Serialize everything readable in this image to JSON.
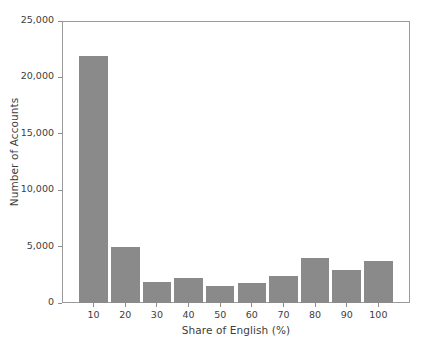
{
  "chart_data": {
    "type": "bar",
    "title": "",
    "xlabel": "Share of English (%)",
    "ylabel": "Number of Accounts",
    "categories": [
      "10",
      "20",
      "30",
      "40",
      "50",
      "60",
      "70",
      "80",
      "90",
      "100"
    ],
    "values": [
      22000,
      5000,
      1900,
      2200,
      1500,
      1800,
      2400,
      4000,
      2900,
      3700
    ],
    "xlim": [
      0,
      110
    ],
    "ylim": [
      0,
      25000
    ],
    "ytick_values": [
      0,
      5000,
      10000,
      15000,
      20000,
      25000
    ],
    "ytick_labels": [
      "0",
      "5,000",
      "10,000",
      "15,000",
      "20,000",
      "25,000"
    ],
    "xtick_values": [
      10,
      20,
      30,
      40,
      50,
      60,
      70,
      80,
      90,
      100
    ],
    "xtick_labels": [
      "10",
      "20",
      "30",
      "40",
      "50",
      "60",
      "70",
      "80",
      "90",
      "100"
    ],
    "grid": false,
    "legend": false,
    "bar_color": "#8a8a8a",
    "axis_color": "#9a9a9a",
    "text_color": "#3d3d3d",
    "background": "#ffffff"
  }
}
